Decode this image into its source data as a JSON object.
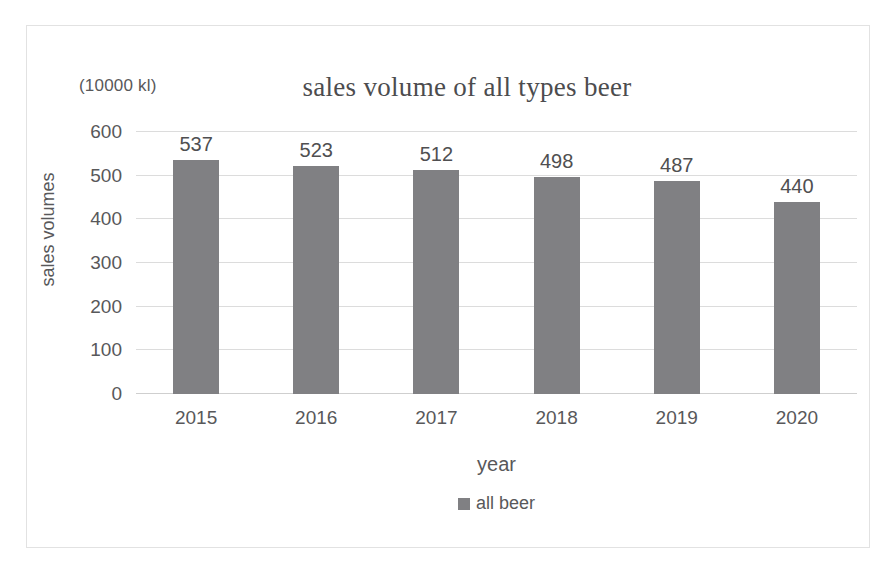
{
  "chart_data": {
    "type": "bar",
    "title": "sales volume of all types beer",
    "unit_note": "(10000 kl)",
    "xlabel": "year",
    "ylabel": "sales volumes",
    "categories": [
      "2015",
      "2016",
      "2017",
      "2018",
      "2019",
      "2020"
    ],
    "series": [
      {
        "name": "all beer",
        "values": [
          537,
          523,
          512,
          498,
          487,
          440
        ],
        "color": "#808083"
      }
    ],
    "data_labels": [
      "537",
      "523",
      "512",
      "498",
      "487",
      "440"
    ],
    "ylim": [
      0,
      600
    ],
    "ytick_values": [
      600,
      500,
      400,
      300,
      200,
      100,
      0
    ],
    "ytick_labels": [
      "600",
      "500",
      "400",
      "300",
      "200",
      "100",
      "0"
    ],
    "grid": true,
    "grid_axis": "y",
    "legend_position": "bottom",
    "legend_entries": [
      "all beer"
    ]
  },
  "figure": {
    "border_color": "#e2e2e2",
    "background": "#ffffff",
    "text_color": "#58585a"
  }
}
